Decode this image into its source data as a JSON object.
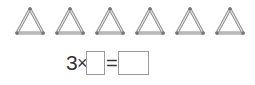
{
  "figure": {
    "triangle_count": 6,
    "triangles": [
      {
        "label": "matchstick-triangle-1",
        "x": 14
      },
      {
        "label": "matchstick-triangle-2",
        "x": 54
      },
      {
        "label": "matchstick-triangle-3",
        "x": 94
      },
      {
        "label": "matchstick-triangle-4",
        "x": 134
      },
      {
        "label": "matchstick-triangle-5",
        "x": 174
      },
      {
        "label": "matchstick-triangle-6",
        "x": 214
      }
    ],
    "stick_color": "#b8b8b8",
    "stick_edge_color": "#8c8c8c"
  },
  "equation": {
    "factor": "3",
    "times_symbol": "×",
    "equals_symbol": "=",
    "blank1": "",
    "blank2": ""
  }
}
